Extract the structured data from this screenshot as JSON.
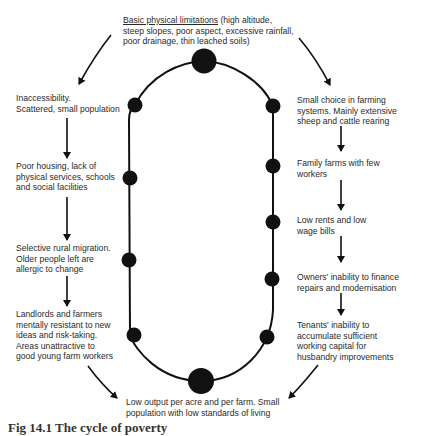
{
  "diagram": {
    "type": "cycle",
    "top": {
      "heading": "Basic physical limitations",
      "lines": [
        "(high altitude,",
        "steep slopes, poor aspect, excessive rainfall,",
        "poor drainage, thin leached soils)"
      ]
    },
    "left_chain": [
      {
        "lines": [
          "Inaccessibility.",
          "Scattered, small population"
        ]
      },
      {
        "lines": [
          "Poor housing, lack of",
          "physical services, schools",
          "and social facilities"
        ]
      },
      {
        "lines": [
          "Selective rural migration.",
          "Older people left are",
          "allergic to change"
        ]
      },
      {
        "lines": [
          "Landlords and farmers",
          "mentally resistant to new",
          "ideas and risk-taking.",
          "Areas unattractive to",
          "good young farm workers"
        ]
      }
    ],
    "right_chain": [
      {
        "lines": [
          "Small choice in farming",
          "systems. Mainly extensive",
          "sheep and cattle rearing"
        ]
      },
      {
        "lines": [
          "Family farms with few",
          "workers"
        ]
      },
      {
        "lines": [
          "Low rents and low",
          "wage bills"
        ]
      },
      {
        "lines": [
          "Owners' inability to finance",
          "repairs and modernisation"
        ]
      },
      {
        "lines": [
          "Tenants' inability to",
          "accumulate sufficient",
          "working capital for",
          "husbandry improvements"
        ]
      }
    ],
    "bottom": {
      "lines": [
        "Low output per acre and per farm. Small",
        "population with low standards of living"
      ]
    },
    "caption": "Fig 14.1  The cycle of poverty",
    "colors": {
      "ink": "#111111",
      "text": "#2a2a2a",
      "background": "#ffffff"
    }
  }
}
